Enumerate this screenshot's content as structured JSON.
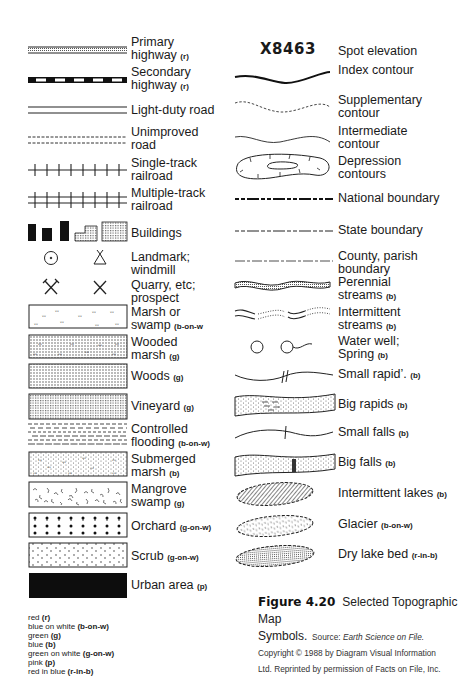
{
  "left_column": [
    {
      "name": "primary-highway",
      "label": "Primary",
      "label2": "highway",
      "code": "(r)"
    },
    {
      "name": "secondary-highway",
      "label": "Secondary",
      "label2": "highway",
      "code": "(r)"
    },
    {
      "name": "light-duty-road",
      "label": "Light-duty road"
    },
    {
      "name": "unimproved-road",
      "label": "Unimproved",
      "label2": "road"
    },
    {
      "name": "single-track-railroad",
      "label": "Single-track",
      "label2": "railroad"
    },
    {
      "name": "multiple-track-railroad",
      "label": "Multiple-track",
      "label2": "railroad"
    },
    {
      "name": "buildings",
      "label": "Buildings"
    },
    {
      "name": "landmark-windmill",
      "label": "Landmark;",
      "label2": "windmill"
    },
    {
      "name": "quarry-prospect",
      "label": "Quarry, etc;",
      "label2": "prospect"
    },
    {
      "name": "marsh-swamp",
      "label": "Marsh or",
      "label2": "swamp",
      "code": "(b-on-w"
    },
    {
      "name": "wooded-marsh",
      "label": "Wooded",
      "label2": "marsh",
      "code": "(g)"
    },
    {
      "name": "woods",
      "label": "Woods",
      "code": "(g)"
    },
    {
      "name": "vineyard",
      "label": "Vineyard",
      "code": "(g)"
    },
    {
      "name": "controlled-flooding",
      "label": "Controlled",
      "label2": "flooding",
      "code": "(b-on-w)"
    },
    {
      "name": "submerged-marsh",
      "label": "Submerged",
      "label2": "marsh",
      "code": "(b)"
    },
    {
      "name": "mangrove-swamp",
      "label": "Mangrove",
      "label2": "swamp",
      "code": "(g)"
    },
    {
      "name": "orchard",
      "label": "Orchard",
      "code": "(g-on-w)"
    },
    {
      "name": "scrub",
      "label": "Scrub",
      "code": "(g-on-w)"
    },
    {
      "name": "urban-area",
      "label": "Urban area",
      "code": "(p)"
    }
  ],
  "right_column": [
    {
      "name": "spot-elevation",
      "symbol_text": "X8463",
      "label": "Spot elevation"
    },
    {
      "name": "index-contour",
      "label": "Index contour"
    },
    {
      "name": "supplementary-contour",
      "label": "Supplementary",
      "label2": "contour"
    },
    {
      "name": "intermediate-contour",
      "label": "Intermediate",
      "label2": "contour"
    },
    {
      "name": "depression-contours",
      "label": "Depression",
      "label2": "contours"
    },
    {
      "name": "national-boundary",
      "label": "National boundary"
    },
    {
      "name": "state-boundary",
      "label": "State boundary"
    },
    {
      "name": "county-parish-boundary",
      "label": "County, parish",
      "label2": "boundary"
    },
    {
      "name": "perennial-streams",
      "label": "Perennial",
      "label2": "streams",
      "code": "(b)"
    },
    {
      "name": "intermittent-streams",
      "label": "Intermittent",
      "label2": "streams",
      "code": "(b)"
    },
    {
      "name": "water-well-spring",
      "label": "Water well;",
      "label2": "Spring",
      "code": "(b)"
    },
    {
      "name": "small-rapids",
      "label": "Small rapid’.",
      "code": "(b)"
    },
    {
      "name": "big-rapids",
      "label": "Big rapids",
      "code": "(b)"
    },
    {
      "name": "small-falls",
      "label": "Small falls",
      "code": "(b)"
    },
    {
      "name": "big-falls",
      "label": "Big falls",
      "code": "(b)"
    },
    {
      "name": "intermittent-lakes",
      "label": "Intermittent lakes",
      "code": "(b)"
    },
    {
      "name": "glacier",
      "label": "Glacier",
      "code": "(b-on-w)"
    },
    {
      "name": "dry-lake-bed",
      "label": "Dry lake bed",
      "code": "(r-in-b)"
    }
  ],
  "color_legend": [
    {
      "text": "red",
      "code": "(r)"
    },
    {
      "text": "blue on white",
      "code": "(b-on-w)"
    },
    {
      "text": "green",
      "code": "(g)"
    },
    {
      "text": "blue",
      "code": "(b)"
    },
    {
      "text": "green on white",
      "code": "(g-on-w)"
    },
    {
      "text": "pink",
      "code": "(p)"
    },
    {
      "text": "red in blue",
      "code": "(r-in-b)"
    }
  ],
  "caption": {
    "figure": "Figure 4.20",
    "title_a": "Selected Topographic Map",
    "title_b": "Symbols.",
    "source_label": "Source:",
    "source_title": "Earth Science on File.",
    "line3": "Copyright © 1988 by Diagram Visual Information",
    "line4": "Ltd. Reprinted by permission of Facts on File, Inc."
  }
}
